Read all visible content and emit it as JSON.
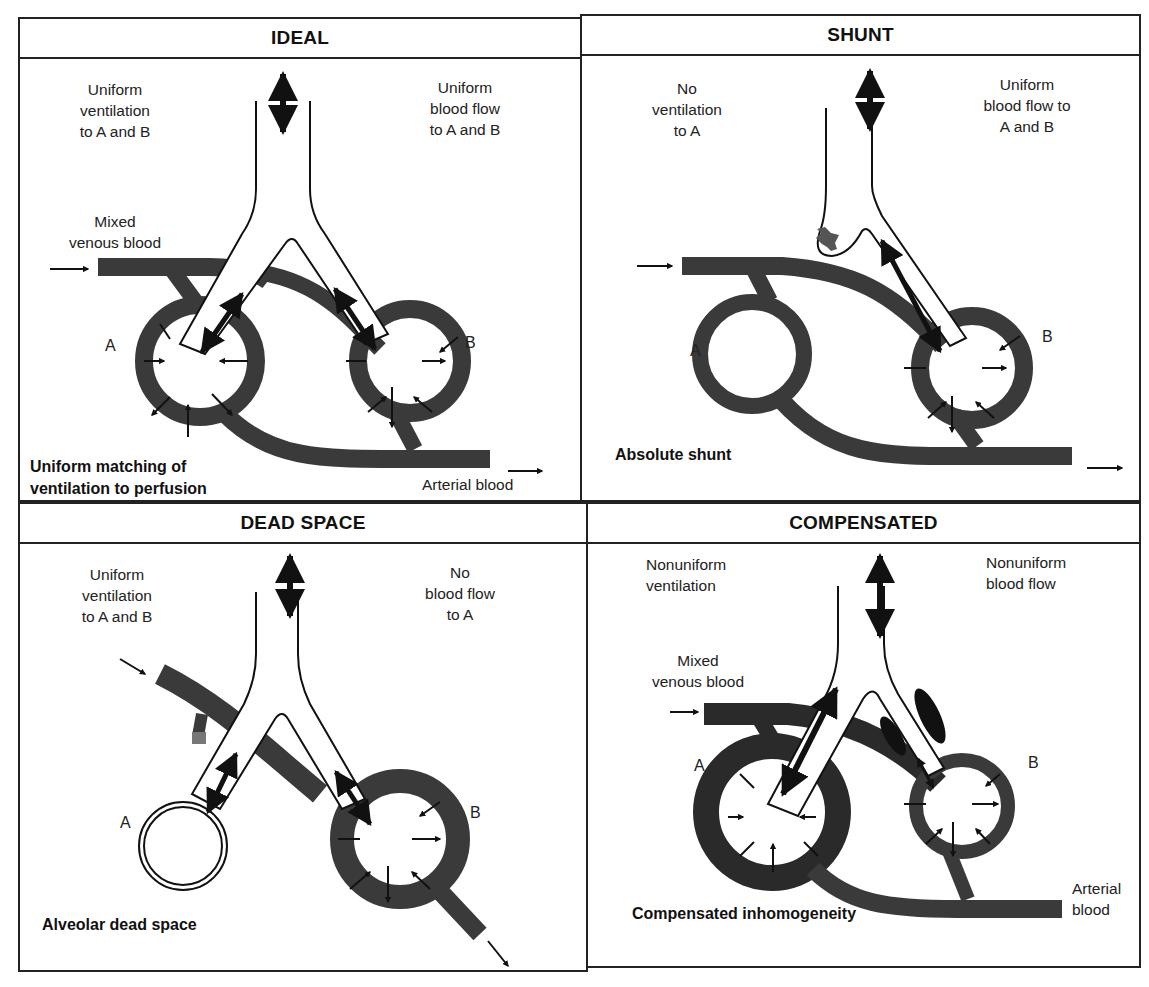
{
  "figure": {
    "colors": {
      "blood_vessel": "#3a3a3a",
      "outline": "#111111",
      "background": "#ffffff"
    },
    "panels": [
      {
        "id": "ideal",
        "title": "IDEAL",
        "ventilation_label": "Uniform\nventilation\nto A and B",
        "ventilation_lines": [
          "Uniform",
          "ventilation",
          "to A and B"
        ],
        "blood_flow_lines": [
          "Uniform",
          "blood flow",
          "to A and B"
        ],
        "inflow_lines": [
          "Mixed",
          "venous blood"
        ],
        "outflow_label": "Arterial blood",
        "caption_lines": [
          "Uniform matching of",
          "ventilation to perfusion"
        ],
        "alveolus_a": "A",
        "alveolus_b": "B"
      },
      {
        "id": "shunt",
        "title": "SHUNT",
        "ventilation_lines": [
          "No",
          "ventilation",
          "to A"
        ],
        "blood_flow_lines": [
          "Uniform",
          "blood flow to",
          "A and B"
        ],
        "caption_lines": [
          "Absolute shunt"
        ],
        "alveolus_a": "A",
        "alveolus_b": "B"
      },
      {
        "id": "dead-space",
        "title": "DEAD SPACE",
        "ventilation_lines": [
          "Uniform",
          "ventilation",
          "to A and B"
        ],
        "blood_flow_lines": [
          "No",
          "blood flow",
          "to A"
        ],
        "caption_lines": [
          "Alveolar dead space"
        ],
        "alveolus_a": "A",
        "alveolus_b": "B"
      },
      {
        "id": "compensated",
        "title": "COMPENSATED",
        "ventilation_lines": [
          "Nonuniform",
          "ventilation"
        ],
        "blood_flow_lines": [
          "Nonuniform",
          "blood flow"
        ],
        "inflow_lines": [
          "Mixed",
          "venous blood"
        ],
        "outflow_lines": [
          "Arterial",
          "blood"
        ],
        "caption_lines": [
          "Compensated inhomogeneity"
        ],
        "alveolus_a": "A",
        "alveolus_b": "B"
      }
    ]
  }
}
